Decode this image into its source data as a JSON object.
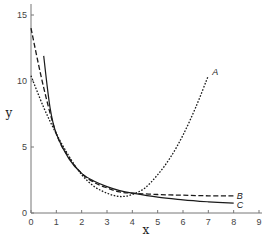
{
  "chart_data": {
    "type": "line",
    "title": "",
    "xlabel": "x",
    "ylabel": "y",
    "xlim": [
      0,
      9
    ],
    "ylim": [
      0,
      15.5
    ],
    "xticks": [
      0,
      1,
      2,
      3,
      4,
      5,
      6,
      7,
      8,
      9
    ],
    "yticks": [
      0,
      5,
      10,
      15
    ],
    "grid": false,
    "legend": "inline labels at curve ends",
    "series": [
      {
        "name": "A",
        "style": "dotted",
        "x": [
          0,
          0.5,
          1,
          1.5,
          2,
          2.5,
          3,
          3.5,
          4,
          4.5,
          5,
          5.5,
          6,
          6.5,
          7
        ],
        "y": [
          10.4,
          8.0,
          6.0,
          4.3,
          2.9,
          2.0,
          1.5,
          1.25,
          1.4,
          1.9,
          2.9,
          4.2,
          5.9,
          8.0,
          10.4
        ]
      },
      {
        "name": "B",
        "style": "dashed",
        "x": [
          0,
          0.5,
          1,
          1.5,
          2,
          2.5,
          3,
          3.5,
          4,
          5,
          6,
          7,
          8
        ],
        "y": [
          14.0,
          9.5,
          6.0,
          4.2,
          3.0,
          2.3,
          1.9,
          1.6,
          1.5,
          1.4,
          1.35,
          1.3,
          1.3
        ]
      },
      {
        "name": "C",
        "style": "solid",
        "x": [
          0.5,
          0.75,
          1,
          1.5,
          2,
          2.5,
          3,
          3.5,
          4,
          5,
          6,
          7,
          8
        ],
        "y": [
          11.9,
          8.0,
          6.0,
          4.1,
          3.0,
          2.4,
          2.0,
          1.7,
          1.5,
          1.2,
          1.0,
          0.85,
          0.75
        ]
      }
    ]
  },
  "axes": {
    "x_label": "x",
    "y_label": "y",
    "x_tick_labels": [
      "0",
      "1",
      "2",
      "3",
      "4",
      "5",
      "6",
      "7",
      "8",
      "9"
    ],
    "y_tick_labels": [
      "0",
      "5",
      "10",
      "15"
    ]
  },
  "series_labels": [
    "A",
    "B",
    "C"
  ]
}
